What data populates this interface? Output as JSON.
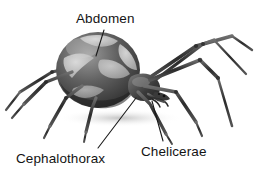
{
  "figure": {
    "background_color": "#ffffff",
    "width": 261,
    "height": 178,
    "style": "grayscale shaded drawing"
  },
  "labels": {
    "abdomen": "Abdomen",
    "cephalothorax": "Cephalothorax",
    "chelicerae": "Chelicerae"
  },
  "colors": {
    "text": "#141414",
    "leader_line": "#1a1a1a",
    "body_dark": "#3b3b3b",
    "body_mid": "#6e6e6e",
    "body_light": "#c9c9c9",
    "marking_light": "#d8d8d8",
    "leg_dark": "#2e2e2e",
    "leg_light": "#8a8a8a",
    "shadow": "#cfcfcf"
  },
  "leader_lines": [
    {
      "name": "abdomen-leader",
      "from_label": "abdomen",
      "x1": 104,
      "y1": 30,
      "x2": 96,
      "y2": 56
    },
    {
      "name": "cephalothorax-leader",
      "from_label": "cephalothorax",
      "x1": 98,
      "y1": 148,
      "x2": 136,
      "y2": 98
    },
    {
      "name": "chelicerae-leader",
      "from_label": "chelicerae",
      "x1": 163,
      "y1": 141,
      "x2": 152,
      "y2": 101
    }
  ]
}
